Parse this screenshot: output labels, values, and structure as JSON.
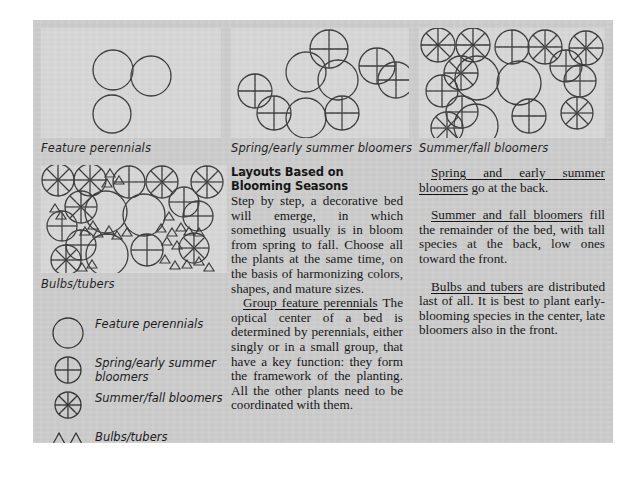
{
  "page": {
    "background_color": "#cbcbcb",
    "panel_color": "#d6d6d6",
    "ink_color": "#2a2a2a"
  },
  "figure_panels": [
    {
      "id": "feature-perennials",
      "caption": "Feature perennials",
      "symbols": [
        "plain-circle"
      ]
    },
    {
      "id": "spring-early-summer-bloomers",
      "caption": "Spring/early summer bloomers",
      "symbols": [
        "plain-circle",
        "cross-circle"
      ]
    },
    {
      "id": "summer-fall-bloomers",
      "caption": "Summer/fall bloomers",
      "symbols": [
        "plain-circle",
        "cross-circle",
        "spoke-circle"
      ]
    },
    {
      "id": "bulbs-tubers",
      "caption": "Bulbs/tubers",
      "symbols": [
        "plain-circle",
        "cross-circle",
        "spoke-circle",
        "triangle"
      ]
    }
  ],
  "legend": {
    "items": [
      {
        "symbol": "plain-circle",
        "label": "Feature perennials"
      },
      {
        "symbol": "cross-circle",
        "label": "Spring/early summer\nbloomers"
      },
      {
        "symbol": "spoke-circle",
        "label": "Summer/fall bloomers"
      },
      {
        "symbol": "triangle-pair",
        "label": "Bulbs/tubers"
      }
    ]
  },
  "middle_column": {
    "heading": "Layouts Based on Blooming Seasons",
    "paragraph_1": "Step by step, a decorative bed will emerge, in which something usually is in bloom from spring to fall. Choose all the plants at the same time, on the basis of harmonizing colors, shapes, and mature sizes.",
    "paragraph_2_lead": "Group feature perennials",
    "paragraph_2": " The optical center of a bed is determined by perennials, either singly or in a small group, that have a key function: they form the framework of the planting. All the other plants need to be coordinated with them."
  },
  "right_column": {
    "paragraph_1_lead": "Spring and early summer bloomers",
    "paragraph_1": " go at the back.",
    "paragraph_2_lead": "Summer and fall bloomers",
    "paragraph_2": " fill the remainder of the bed, with tall species at the back, low ones toward the front.",
    "paragraph_3_lead": "Bulbs and tubers",
    "paragraph_3": " are distributed last of all. It is best to plant early-blooming species in the center, late bloomers also in the front."
  }
}
